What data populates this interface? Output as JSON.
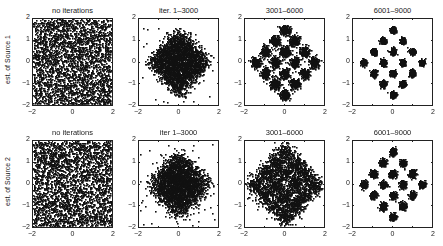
{
  "figure": {
    "row_labels": [
      "est. of Source 1",
      "est. of Source 2"
    ],
    "column_titles_row1": [
      "no iterations",
      "iter. 1–3000",
      "3001–6000",
      "6001–9000"
    ],
    "column_titles_row2": [
      "no iterations",
      "iter 1–3000",
      "3001–6000",
      "6001–9000"
    ],
    "x_ticks": [
      "−2",
      "0",
      "2"
    ],
    "y_ticks": [
      "2",
      "1",
      "0",
      "−1",
      "−2"
    ]
  },
  "chart_data": [
    {
      "type": "scatter",
      "row": 1,
      "title": "no iterations",
      "ylabel": "est. of Source 1",
      "xlim": [
        -2,
        2
      ],
      "ylim": [
        -2,
        2
      ],
      "distribution": "uniform",
      "spread": 2.0,
      "points": 3000
    },
    {
      "type": "scatter",
      "row": 1,
      "title": "iter. 1–3000",
      "xlim": [
        -2,
        2
      ],
      "ylim": [
        -2,
        2
      ],
      "distribution": "diamond-blur",
      "spread": 1.6,
      "noise": 0.35,
      "points": 3000
    },
    {
      "type": "scatter",
      "row": 1,
      "title": "3001–6000",
      "xlim": [
        -2,
        2
      ],
      "ylim": [
        -2,
        2
      ],
      "distribution": "16qam-rotated",
      "noise": 0.12,
      "points": 3000
    },
    {
      "type": "scatter",
      "row": 1,
      "title": "6001–9000",
      "xlim": [
        -2,
        2
      ],
      "ylim": [
        -2,
        2
      ],
      "distribution": "16qam-rotated",
      "noise": 0.07,
      "points": 3000
    },
    {
      "type": "scatter",
      "row": 2,
      "title": "no iterations",
      "ylabel": "est. of Source 2",
      "xlim": [
        -2,
        2
      ],
      "ylim": [
        -2,
        2
      ],
      "distribution": "uniform",
      "spread": 2.0,
      "points": 3000
    },
    {
      "type": "scatter",
      "row": 2,
      "title": "iter 1–3000",
      "xlim": [
        -2,
        2
      ],
      "ylim": [
        -2,
        2
      ],
      "distribution": "diamond-blur",
      "spread": 1.5,
      "noise": 0.45,
      "points": 3000
    },
    {
      "type": "scatter",
      "row": 2,
      "title": "3001–6000",
      "xlim": [
        -2,
        2
      ],
      "ylim": [
        -2,
        2
      ],
      "distribution": "16qam-rotated",
      "noise": 0.22,
      "points": 3000
    },
    {
      "type": "scatter",
      "row": 2,
      "title": "6001–9000",
      "xlim": [
        -2,
        2
      ],
      "ylim": [
        -2,
        2
      ],
      "distribution": "16qam-rotated",
      "noise": 0.08,
      "points": 3000
    }
  ]
}
